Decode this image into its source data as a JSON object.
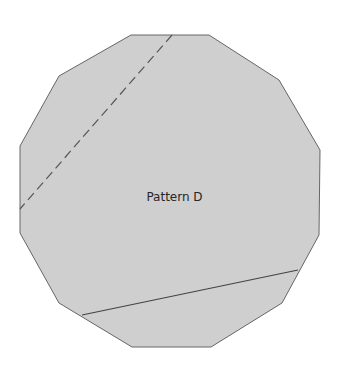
{
  "diagram": {
    "label": "Pattern D",
    "shape": "dodecagon",
    "fill": "#cfcfcf",
    "stroke": "#666666",
    "line_color": "#555555",
    "vertices": [
      [
        131,
        35
      ],
      [
        209,
        35
      ],
      [
        279,
        80
      ],
      [
        320,
        150
      ],
      [
        319,
        235
      ],
      [
        282,
        303
      ],
      [
        211,
        347
      ],
      [
        132,
        347
      ],
      [
        59,
        303
      ],
      [
        20,
        233
      ],
      [
        20,
        146
      ],
      [
        59,
        76
      ]
    ],
    "dashed_line": {
      "x1": 172,
      "y1": 35,
      "x2": 20,
      "y2": 209
    },
    "solid_line": {
      "x1": 82,
      "y1": 315,
      "x2": 298,
      "y2": 270
    }
  }
}
